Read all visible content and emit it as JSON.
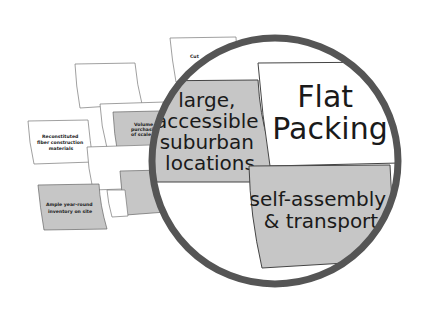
{
  "diagram": {
    "type": "magnified-card-cluster",
    "colors": {
      "background": "#ffffff",
      "card_white": "#ffffff",
      "card_gray": "#c9c9c9",
      "card_border": "#555555",
      "lens_ring": "#555555",
      "text": "#1a1a1a"
    },
    "background_cards": [
      {
        "id": "reconstituted",
        "lines": [
          "Reconstituted",
          "fiber construction",
          "materials"
        ],
        "fill": "white"
      },
      {
        "id": "volume",
        "lines": [
          "Volume",
          "purchasing",
          "of scale"
        ],
        "fill": "gray"
      },
      {
        "id": "cut",
        "lines": [
          "Cut",
          "..."
        ],
        "fill": "white"
      },
      {
        "id": "ample",
        "lines": [
          "Ample year-round",
          "inventory on site"
        ],
        "fill": "gray"
      }
    ],
    "lens": {
      "cards": [
        {
          "id": "large-locations",
          "lines": [
            "large,",
            "accessible",
            "suburban",
            "locations"
          ],
          "fill": "gray"
        },
        {
          "id": "flat-packing",
          "lines": [
            "Flat",
            "Packing"
          ],
          "fill": "white"
        },
        {
          "id": "self-assembly",
          "lines": [
            "self-assembly",
            "& transport"
          ],
          "fill": "gray"
        }
      ]
    }
  }
}
